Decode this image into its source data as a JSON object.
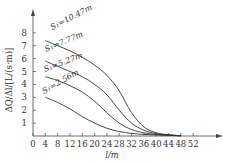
{
  "chart_data": {
    "type": "line",
    "title": "",
    "xlabel": "l/m",
    "ylabel": "ΔQ/Δl/[L/(s·m)]",
    "xlim": [
      0,
      56
    ],
    "ylim": [
      0,
      9
    ],
    "x_ticks": [
      0,
      4,
      8,
      12,
      16,
      20,
      24,
      28,
      32,
      36,
      40,
      44,
      48,
      52
    ],
    "y_ticks": [
      1,
      2,
      3,
      4,
      5,
      6,
      7,
      8
    ],
    "grid": false,
    "legend": "inline labels on curves",
    "series": [
      {
        "name": "S1=10.47m",
        "x": [
          4,
          8,
          12,
          16,
          20,
          24,
          28,
          32,
          36,
          40,
          44
        ],
        "values": [
          7.4,
          7.0,
          6.6,
          6.1,
          5.5,
          4.7,
          3.5,
          1.8,
          0.7,
          0.25,
          0.1
        ]
      },
      {
        "name": "S1=7.77m",
        "x": [
          4,
          8,
          12,
          16,
          20,
          24,
          28,
          32,
          36,
          40,
          44
        ],
        "values": [
          5.8,
          5.4,
          5.0,
          4.6,
          4.0,
          3.2,
          2.0,
          1.0,
          0.45,
          0.18,
          0.08
        ]
      },
      {
        "name": "S1=5.27m",
        "x": [
          4,
          8,
          12,
          16,
          20,
          24,
          28,
          32,
          36,
          40,
          44
        ],
        "values": [
          4.6,
          4.3,
          3.9,
          3.4,
          2.7,
          1.8,
          1.0,
          0.5,
          0.25,
          0.12,
          0.06
        ]
      },
      {
        "name": "S1=2.56m",
        "x": [
          4,
          8,
          12,
          16,
          20,
          24,
          28,
          32,
          36,
          40,
          44
        ],
        "values": [
          3.0,
          2.6,
          2.1,
          1.5,
          1.0,
          0.6,
          0.35,
          0.2,
          0.12,
          0.08,
          0.05
        ]
      }
    ]
  },
  "labels": {
    "xlabel": "l/m",
    "ylabel": "ΔQ/Δl/[L/(s·m)]",
    "curves": [
      "S₁=10.47m",
      "S₁=7.77m",
      "S₁=5.27m",
      "S₁=2.56m"
    ],
    "x_ticks": [
      "0",
      "4",
      "8",
      "12",
      "16",
      "20",
      "24",
      "28",
      "32",
      "36",
      "40",
      "44",
      "48",
      "52"
    ],
    "y_ticks": [
      "1",
      "2",
      "3",
      "4",
      "5",
      "6",
      "7",
      "8"
    ]
  }
}
